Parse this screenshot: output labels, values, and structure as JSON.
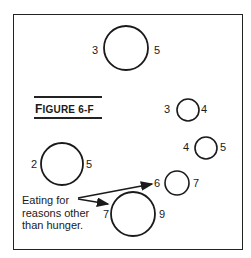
{
  "figure": {
    "label_first": "F",
    "label_rest": "IGURE 6-F"
  },
  "circles": [
    {
      "id": "top-large",
      "left_num": "3",
      "right_num": "5"
    },
    {
      "id": "small-upper-right",
      "left_num": "3",
      "right_num": "4"
    },
    {
      "id": "small-right",
      "left_num": "4",
      "right_num": "5"
    },
    {
      "id": "medium-left",
      "left_num": "2",
      "right_num": "5"
    },
    {
      "id": "small-lower-right",
      "left_num": "6",
      "right_num": "7"
    },
    {
      "id": "large-bottom",
      "left_num": "7",
      "right_num": "9"
    }
  ],
  "annotation": {
    "line1": "Eating for",
    "line2": "reasons other",
    "line3": "than hunger."
  },
  "colors": {
    "stroke": "#1a1a1a",
    "background": "#ffffff"
  }
}
